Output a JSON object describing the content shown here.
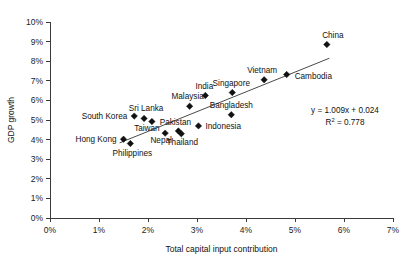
{
  "chart_data": {
    "type": "scatter",
    "title": "",
    "xlabel": "Total capital input contribution",
    "ylabel": "GDP growth",
    "xlim": [
      0,
      7
    ],
    "ylim": [
      0,
      10
    ],
    "xticks": [
      "0%",
      "1%",
      "2%",
      "3%",
      "4%",
      "5%",
      "6%",
      "7%"
    ],
    "yticks": [
      "0%",
      "1%",
      "2%",
      "3%",
      "4%",
      "5%",
      "6%",
      "7%",
      "8%",
      "9%",
      "10%"
    ],
    "grid": false,
    "legend": "none",
    "marker_shape": "diamond",
    "marker_color": "#111111",
    "points": [
      {
        "label": "China",
        "x": 5.65,
        "y": 8.85,
        "label_dx": 6,
        "label_dy": -7,
        "anchor": "middle"
      },
      {
        "label": "Cambodia",
        "x": 4.83,
        "y": 7.32,
        "label_dx": 8,
        "label_dy": 4,
        "anchor": "start"
      },
      {
        "label": "Vietnam",
        "x": 4.37,
        "y": 7.05,
        "label_dx": -2,
        "label_dy": -7,
        "anchor": "middle"
      },
      {
        "label": "Singapore",
        "x": 3.72,
        "y": 6.4,
        "label_dx": -1,
        "label_dy": -7,
        "anchor": "middle"
      },
      {
        "label": "India",
        "x": 3.17,
        "y": 6.25,
        "label_dx": -1,
        "label_dy": -7,
        "anchor": "middle"
      },
      {
        "label": "Bangladesh",
        "x": 3.7,
        "y": 5.27,
        "label_dx": 0,
        "label_dy": -7,
        "anchor": "middle"
      },
      {
        "label": "Malaysia",
        "x": 2.85,
        "y": 5.7,
        "label_dx": -2,
        "label_dy": -7,
        "anchor": "middle"
      },
      {
        "label": "Indonesia",
        "x": 3.03,
        "y": 4.7,
        "label_dx": 7,
        "label_dy": 3,
        "anchor": "start"
      },
      {
        "label": "Sri Lanka",
        "x": 1.92,
        "y": 5.08,
        "label_dx": 2,
        "label_dy": -7,
        "anchor": "middle"
      },
      {
        "label": "South Korea",
        "x": 1.72,
        "y": 5.2,
        "label_dx": -7,
        "label_dy": 3,
        "anchor": "end"
      },
      {
        "label": "Taiwan",
        "x": 2.08,
        "y": 4.92,
        "label_dx": -5,
        "label_dy": 9,
        "anchor": "middle"
      },
      {
        "label": "Pakistan",
        "x": 2.62,
        "y": 4.44,
        "label_dx": -3,
        "label_dy": -6,
        "anchor": "middle"
      },
      {
        "label": "Thailand",
        "x": 2.68,
        "y": 4.3,
        "label_dx": 1,
        "label_dy": 11,
        "anchor": "middle"
      },
      {
        "label": "Nepal",
        "x": 2.35,
        "y": 4.33,
        "label_dx": -4,
        "label_dy": 10,
        "anchor": "middle"
      },
      {
        "label": "Hong Kong",
        "x": 1.5,
        "y": 4.02,
        "label_dx": -7,
        "label_dy": 3,
        "anchor": "end"
      },
      {
        "label": "Philippines",
        "x": 1.64,
        "y": 3.8,
        "label_dx": 2,
        "label_dy": 12,
        "anchor": "middle"
      }
    ],
    "trendline": {
      "slope": 1.009,
      "intercept": 0.024,
      "x_start": 1.42,
      "x_end": 5.7
    },
    "annotation": {
      "equation": "y = 1.009x + 0.024",
      "r_squared_prefix": "R",
      "r_squared_sup": "2",
      "r_squared_value": " = 0.778"
    }
  }
}
